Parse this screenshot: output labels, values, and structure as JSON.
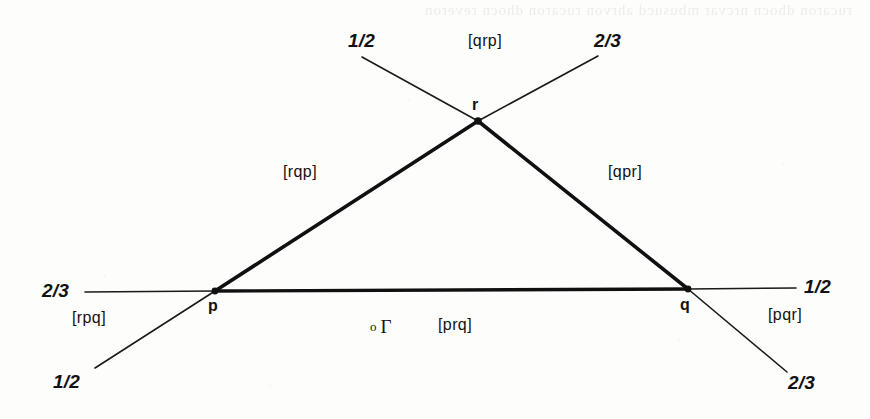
{
  "figure": {
    "background_color": "#fdfdfc",
    "ink_color": "#121212",
    "vertices": [
      {
        "name": "p",
        "label": "p",
        "x": 215,
        "y": 291
      },
      {
        "name": "q",
        "label": "q",
        "x": 688,
        "y": 289
      },
      {
        "name": "r",
        "label": "r",
        "x": 478,
        "y": 121
      }
    ],
    "origin_marker": {
      "dot": "o",
      "label": "Γ",
      "x": 372,
      "y": 327
    },
    "edges": [
      {
        "name": "edge-pr",
        "from": "p",
        "to": "r",
        "weight": "thick"
      },
      {
        "name": "edge-rq",
        "from": "r",
        "to": "q",
        "weight": "thick"
      },
      {
        "name": "edge-pq",
        "from": "p",
        "to": "q",
        "weight": "thick"
      }
    ],
    "extensions": [
      {
        "name": "ext-pr-up",
        "through": "r",
        "label": "2/3",
        "x1": 478,
        "y1": 121,
        "x2": 598,
        "y2": 56
      },
      {
        "name": "ext-pr-down",
        "through": "p",
        "label": "1/2",
        "x1": 215,
        "y1": 291,
        "x2": 95,
        "y2": 368
      },
      {
        "name": "ext-qr-up",
        "through": "r",
        "label": "1/2",
        "x1": 478,
        "y1": 121,
        "x2": 362,
        "y2": 57
      },
      {
        "name": "ext-qr-down",
        "through": "q",
        "label": "2/3",
        "x1": 688,
        "y1": 289,
        "x2": 787,
        "y2": 372
      },
      {
        "name": "ext-pq-left",
        "through": "p",
        "label": "2/3",
        "x1": 215,
        "y1": 291,
        "x2": 85,
        "y2": 292
      },
      {
        "name": "ext-pq-right",
        "through": "q",
        "label": "1/2",
        "x1": 688,
        "y1": 289,
        "x2": 796,
        "y2": 288
      }
    ],
    "fraction_labels": [
      {
        "name": "fraction-top-left",
        "text": "1/2",
        "x": 348,
        "y": 30
      },
      {
        "name": "fraction-top-right",
        "text": "2/3",
        "x": 594,
        "y": 30
      },
      {
        "name": "fraction-left",
        "text": "2/3",
        "x": 42,
        "y": 280
      },
      {
        "name": "fraction-right",
        "text": "1/2",
        "x": 804,
        "y": 276
      },
      {
        "name": "fraction-bottom-left",
        "text": "1/2",
        "x": 53,
        "y": 371
      },
      {
        "name": "fraction-bottom-right",
        "text": "2/3",
        "x": 788,
        "y": 372
      }
    ],
    "region_labels": [
      {
        "name": "region-qrp",
        "text": "[qrp]",
        "x": 468,
        "y": 32
      },
      {
        "name": "region-rqp",
        "text": "[rqp]",
        "x": 283,
        "y": 163
      },
      {
        "name": "region-qpr",
        "text": "[qpr]",
        "x": 608,
        "y": 163
      },
      {
        "name": "region-rpq",
        "text": "[rpq]",
        "x": 72,
        "y": 309
      },
      {
        "name": "region-prq",
        "text": "[prq]",
        "x": 438,
        "y": 316
      },
      {
        "name": "region-pqr",
        "text": "[pqr]",
        "x": 768,
        "y": 306
      }
    ],
    "bleed_text": "rucaron  dhocn  nrcvar  mbusucd  ahrvon  rucaron  dhocn  reveron"
  }
}
